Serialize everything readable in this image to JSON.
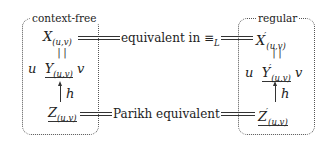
{
  "left_box": {
    "label": "context-free",
    "X": {
      "base": "X",
      "sub": "(u,v)",
      "prime": ""
    },
    "eq": "||",
    "Y": {
      "prefix": "u",
      "base": "Y",
      "sub": "(u,v)",
      "prime": "",
      "suffix": "v"
    },
    "arrow_label": "h",
    "Z": {
      "base": "Z",
      "sub": "(u,v)",
      "prime": ""
    }
  },
  "right_box": {
    "label": "regular",
    "X": {
      "base": "X",
      "sub": "(u,v)",
      "prime": "′"
    },
    "eq": "||",
    "Y": {
      "prefix": "u",
      "base": "Y",
      "sub": "(u,v)",
      "prime": "′",
      "suffix": "v"
    },
    "arrow_label": "h",
    "Z": {
      "base": "Z",
      "sub": "(u,v)",
      "prime": "′"
    }
  },
  "relations": {
    "top": {
      "text": "equivalent in ",
      "symbol": "≡",
      "symbol_sub": "L"
    },
    "bottom": {
      "text": "Parikh equivalent"
    }
  }
}
